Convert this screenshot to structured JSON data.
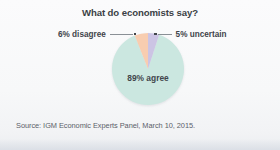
{
  "chart_data": {
    "type": "pie",
    "title": "What do economists say?",
    "xlabel": "",
    "ylabel": "",
    "categories": [
      "agree",
      "disagree",
      "uncertain"
    ],
    "values": [
      89,
      6,
      5
    ],
    "labels": [
      "89% agree",
      "6% disagree",
      "5% uncertain"
    ],
    "colors": [
      "#cbe7e0",
      "#f8cdb0",
      "#ccc4e4"
    ],
    "legend_position": "callout-labels",
    "grid": false,
    "annotations": [
      {
        "text": "6% disagree",
        "side": "left",
        "target_slice": "disagree"
      },
      {
        "text": "5% uncertain",
        "side": "right",
        "target_slice": "uncertain"
      },
      {
        "text": "89% agree",
        "side": "inside",
        "target_slice": "agree"
      }
    ]
  },
  "figure": {
    "title": "What do economists say?",
    "slice_label_agree": "89% agree",
    "callout_left": "6% disagree",
    "callout_right": "5% uncertain",
    "source": "Source: IGM Economic Experts Panel, March 10, 2015.",
    "background_color": "#f7f8f9",
    "text_color": "#3b3f45",
    "source_color": "#5b6169",
    "leader_color": "#8a9096"
  }
}
